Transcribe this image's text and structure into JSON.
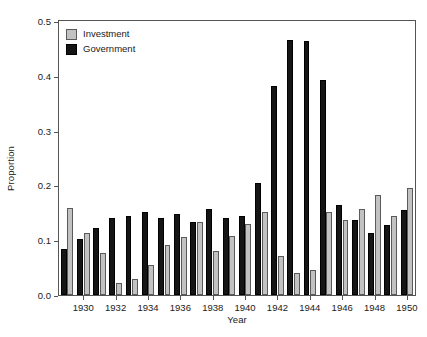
{
  "chart_data": {
    "type": "bar",
    "title": "",
    "xlabel": "Year",
    "ylabel": "Proportion",
    "ylim": [
      0.0,
      0.5
    ],
    "xlim": [
      1928.5,
      1950.5
    ],
    "grid": false,
    "legend_position": "top-left",
    "ytick_labels": [
      "0.0",
      "0.1",
      "0.2",
      "0.3",
      "0.4",
      "0.5"
    ],
    "ytick_values": [
      0.0,
      0.1,
      0.2,
      0.3,
      0.4,
      0.5
    ],
    "xtick_labels": [
      "1930",
      "1932",
      "1934",
      "1936",
      "1938",
      "1940",
      "1942",
      "1944",
      "1946",
      "1948",
      "1950"
    ],
    "xtick_values": [
      1930,
      1932,
      1934,
      1936,
      1938,
      1940,
      1942,
      1944,
      1946,
      1948,
      1950
    ],
    "categories": [
      1929,
      1930,
      1931,
      1932,
      1933,
      1934,
      1935,
      1936,
      1937,
      1938,
      1939,
      1940,
      1941,
      1942,
      1943,
      1944,
      1945,
      1946,
      1947,
      1948,
      1949,
      1950
    ],
    "series": [
      {
        "name": "Government",
        "color": "#151515",
        "values": [
          0.084,
          0.103,
          0.122,
          0.14,
          0.145,
          0.152,
          0.14,
          0.148,
          0.133,
          0.157,
          0.14,
          0.145,
          0.204,
          0.381,
          0.465,
          0.463,
          0.392,
          0.164,
          0.137,
          0.114,
          0.128,
          0.155
        ]
      },
      {
        "name": "Investment",
        "color": "#c2c2c2",
        "values": [
          0.159,
          0.114,
          0.077,
          0.022,
          0.029,
          0.054,
          0.092,
          0.105,
          0.133,
          0.08,
          0.107,
          0.13,
          0.151,
          0.071,
          0.04,
          0.046,
          0.151,
          0.136,
          0.157,
          0.182,
          0.144,
          0.196
        ]
      }
    ]
  },
  "legend": {
    "items": [
      {
        "label": "Investment",
        "swatch": "inv"
      },
      {
        "label": "Government",
        "swatch": "gov"
      }
    ]
  }
}
